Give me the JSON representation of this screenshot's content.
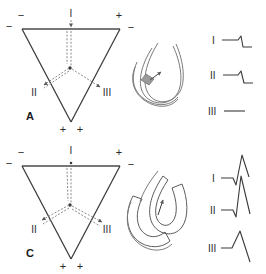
{
  "figure": {
    "background_color": "#ffffff",
    "line_color": "#3a3a3a",
    "dash_color": "#8a8a8a",
    "width": 266,
    "height": 274
  },
  "panels": [
    {
      "id": "A",
      "label": "A",
      "triangle": {
        "lead_I_label": "I",
        "lead_II_label": "II",
        "lead_III_label": "III",
        "polarity_top_left_above": "−",
        "polarity_top_left_outer": "−",
        "polarity_top_center": "I",
        "polarity_top_right_above": "+",
        "polarity_top_right_outer": "−",
        "polarity_bottom_left": "+",
        "polarity_bottom_right": "+"
      },
      "loop": {
        "name": "conduction-loop-open",
        "style": "open thin outline loop",
        "arrow_label": ""
      },
      "tracings": [
        {
          "lead": "I",
          "shape": "flat-then-small-negative",
          "amplitude": -0.2
        },
        {
          "lead": "II",
          "shape": "flat-then-small-negative",
          "amplitude": -0.2
        },
        {
          "lead": "III",
          "shape": "flat",
          "amplitude": 0
        }
      ]
    },
    {
      "id": "C",
      "label": "C",
      "triangle": {
        "lead_I_label": "I",
        "lead_II_label": "II",
        "lead_III_label": "III",
        "polarity_top_left_above": "−",
        "polarity_top_left_outer": "−",
        "polarity_top_center": "I",
        "polarity_top_right_above": "+",
        "polarity_top_right_outer": "−",
        "polarity_bottom_left": "+",
        "polarity_bottom_right": "+"
      },
      "loop": {
        "name": "conduction-loop-hatched",
        "style": "hatched shaded band loop",
        "arrow_label": ""
      },
      "tracings": [
        {
          "lead": "I",
          "shape": "small-q-then-tall-r",
          "amplitude": 1.0
        },
        {
          "lead": "II",
          "shape": "small-q-then-tall-r",
          "amplitude": 1.1
        },
        {
          "lead": "III",
          "shape": "simple-upward-r",
          "amplitude": 0.6
        }
      ]
    }
  ]
}
